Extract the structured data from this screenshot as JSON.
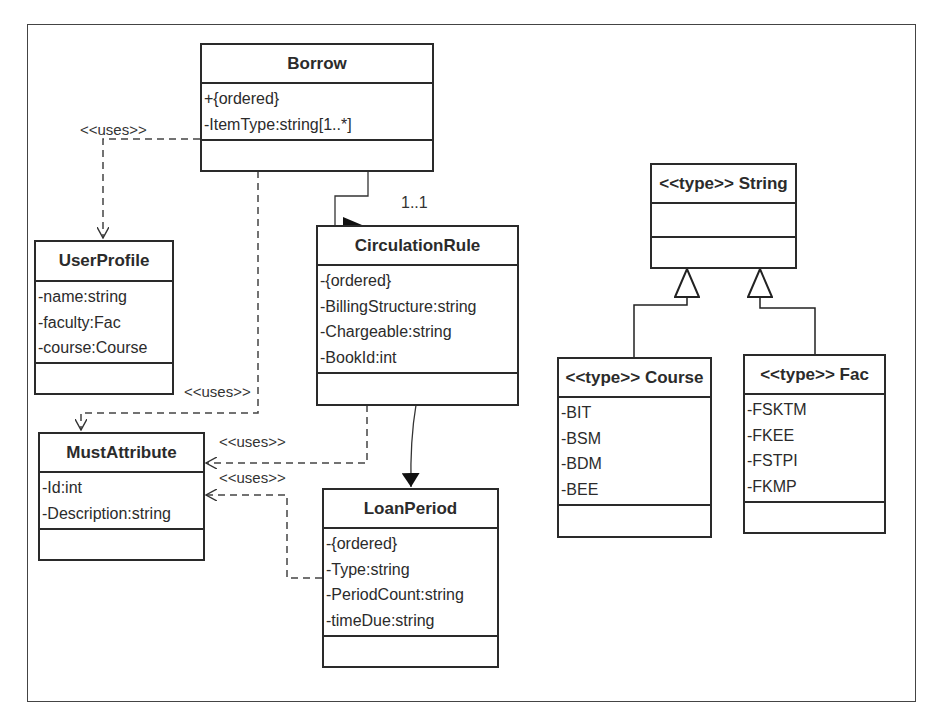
{
  "diagram": {
    "type": "UML class diagram",
    "classes": {
      "borrow": {
        "name": "Borrow",
        "attributes": [
          "+{ordered}",
          "-ItemType:string[1..*]"
        ],
        "operations": []
      },
      "user_profile": {
        "name": "UserProfile",
        "attributes": [
          "-name:string",
          "-faculty:Fac",
          "-course:Course"
        ],
        "operations": []
      },
      "must_attribute": {
        "name": "MustAttribute",
        "attributes": [
          "-Id:int",
          "-Description:string"
        ],
        "operations": []
      },
      "circulation_rule": {
        "name": "CirculationRule",
        "attributes": [
          "-{ordered}",
          "-BillingStructure:string",
          "-Chargeable:string",
          "-BookId:int"
        ],
        "operations": []
      },
      "loan_period": {
        "name": "LoanPeriod",
        "attributes": [
          "-{ordered}",
          "-Type:string",
          "-PeriodCount:string",
          "-timeDue:string"
        ],
        "operations": []
      },
      "string_type": {
        "name": "<<type>> String",
        "attributes": [],
        "operations": []
      },
      "course_type": {
        "name": "<<type>> Course",
        "attributes": [
          "-BIT",
          "-BSM",
          "-BDM",
          "-BEE"
        ],
        "operations": []
      },
      "fac_type": {
        "name": "<<type>> Fac",
        "attributes": [
          "-FSKTM",
          "-FKEE",
          "-FSTPI",
          "-FKMP"
        ],
        "operations": []
      }
    },
    "relationships": [
      {
        "from": "Borrow",
        "to": "UserProfile",
        "kind": "dependency",
        "label": "<<uses>>"
      },
      {
        "from": "Borrow",
        "to": "MustAttribute",
        "kind": "dependency",
        "label": "<<uses>>"
      },
      {
        "from": "CirculationRule",
        "to": "MustAttribute",
        "kind": "dependency",
        "label": "<<uses>>"
      },
      {
        "from": "LoanPeriod",
        "to": "MustAttribute",
        "kind": "dependency",
        "label": "<<uses>>"
      },
      {
        "from": "Borrow",
        "to": "CirculationRule",
        "kind": "association",
        "multiplicity": "1..1"
      },
      {
        "from": "CirculationRule",
        "to": "LoanPeriod",
        "kind": "directed-association"
      },
      {
        "from": "Course",
        "to": "String",
        "kind": "generalization"
      },
      {
        "from": "Fac",
        "to": "String",
        "kind": "generalization"
      }
    ],
    "labels": {
      "uses_1": "<<uses>>",
      "uses_2": "<<uses>>",
      "uses_3": "<<uses>>",
      "uses_4": "<<uses>>",
      "multiplicity": "1..1"
    }
  }
}
